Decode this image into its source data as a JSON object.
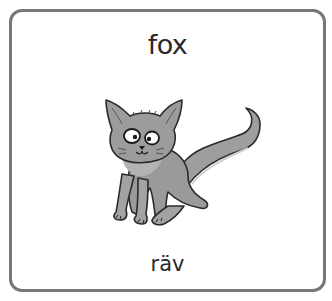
{
  "card": {
    "word_english": "fox",
    "word_swedish": "räv",
    "illustration": "fox-illustration",
    "border_color": "#777777",
    "fur_color": "#9a9a9a"
  }
}
